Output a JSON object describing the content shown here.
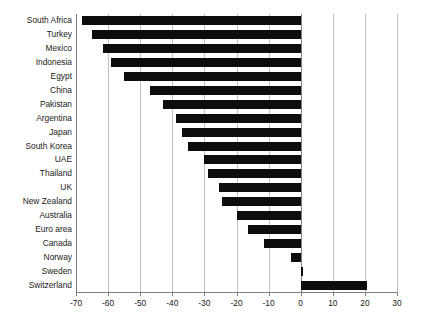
{
  "chart_data": {
    "type": "bar",
    "orientation": "horizontal",
    "title": "",
    "subtitle": "",
    "xlabel": "",
    "ylabel": "",
    "xlim": [
      -70,
      30
    ],
    "xticks": [
      -70,
      -60,
      -50,
      -40,
      -30,
      -20,
      -10,
      0,
      10,
      20,
      30
    ],
    "xtick_labels": [
      "-70",
      "-60",
      "-50",
      "-40",
      "-30",
      "-20",
      "-10",
      "0",
      "10",
      "20",
      "30"
    ],
    "grid": true,
    "grid_axis": "x",
    "legend": false,
    "legend_position": "none",
    "bar_color": "#0d0d0d",
    "grid_color": "#bfbfbf",
    "axis_color": "#808080",
    "categories": [
      "South Africa",
      "Turkey",
      "Mexico",
      "Indonesia",
      "Egypt",
      "China",
      "Pakistan",
      "Argentina",
      "Japan",
      "South Korea",
      "UAE",
      "Thailand",
      "UK",
      "New Zealand",
      "Australia",
      "Euro area",
      "Canada",
      "Norway",
      "Sweden",
      "Switzerland"
    ],
    "values": [
      -68.0,
      -65.0,
      -61.5,
      -59.0,
      -55.0,
      -47.0,
      -43.0,
      -39.0,
      -37.0,
      -35.0,
      -30.0,
      -29.0,
      -25.5,
      -24.5,
      -20.0,
      -16.5,
      -11.5,
      -3.0,
      0.7,
      20.7
    ]
  }
}
